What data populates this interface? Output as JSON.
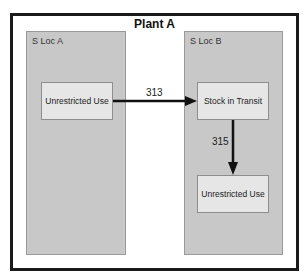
{
  "diagram": {
    "title": "Plant A",
    "storage_locations": [
      {
        "label": "S Loc A"
      },
      {
        "label": "S Loc B"
      }
    ],
    "nodes": [
      {
        "id": "unrestricted_a",
        "label": "Unrestricted Use",
        "location": "S Loc A"
      },
      {
        "id": "stock_in_transit",
        "label": "Stock in Transit",
        "location": "S Loc B"
      },
      {
        "id": "unrestricted_b",
        "label": "Unrestricted Use",
        "location": "S Loc B"
      }
    ],
    "edges": [
      {
        "from": "unrestricted_a",
        "to": "stock_in_transit",
        "label": "313"
      },
      {
        "from": "stock_in_transit",
        "to": "unrestricted_b",
        "label": "315"
      }
    ],
    "colors": {
      "frame": "#1a1a1a",
      "sloc_fill": "#c8c8c8",
      "box_fill": "#e6e6e6",
      "arrow": "#111111"
    }
  }
}
